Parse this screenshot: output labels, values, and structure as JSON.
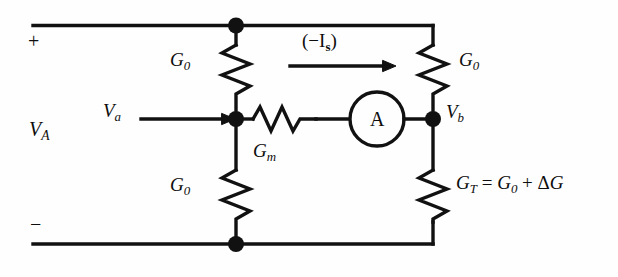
{
  "diagram": {
    "stroke_color": "#111111",
    "background_color": "#fefefe"
  },
  "terminals": {
    "plus": "+",
    "minus": "−",
    "source_label": "V",
    "source_sub": "A"
  },
  "nodes": {
    "a_label": "V",
    "a_sub": "a",
    "b_label": "V",
    "b_sub": "b"
  },
  "current": {
    "label_open": "(",
    "label_minus": "−",
    "label_symbol": "I",
    "label_sub": "s",
    "label_close": ")"
  },
  "components": {
    "r_top_left": {
      "symbol": "G",
      "sub": "0"
    },
    "r_bottom_left": {
      "symbol": "G",
      "sub": "0"
    },
    "r_top_right": {
      "symbol": "G",
      "sub": "0"
    },
    "r_middle": {
      "symbol": "G",
      "sub": "m"
    },
    "r_bottom_right": {
      "symbol": "G",
      "sub": "T",
      "equals": "=",
      "term1_symbol": "G",
      "term1_sub": "0",
      "plus": "+",
      "delta": "Δ",
      "term2_symbol": "G"
    },
    "ammeter": {
      "label": "A"
    }
  }
}
